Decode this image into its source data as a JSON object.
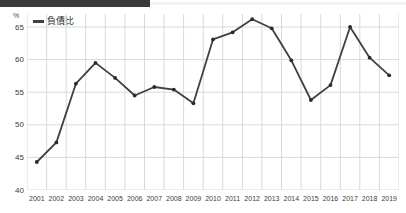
{
  "chart_data": {
    "type": "line",
    "title": "",
    "xlabel": "",
    "ylabel": "%",
    "unit_label": "%",
    "categories": [
      "2001",
      "2002",
      "2003",
      "2004",
      "2005",
      "2006",
      "2007",
      "2008",
      "2009",
      "2010",
      "2011",
      "2012",
      "2013",
      "2014",
      "2015",
      "2016",
      "2017",
      "2018",
      "2019"
    ],
    "series": [
      {
        "name": "負債比",
        "values": [
          44.3,
          47.3,
          56.3,
          59.5,
          57.2,
          54.5,
          55.8,
          55.4,
          53.3,
          63.1,
          64.2,
          66.2,
          64.8,
          59.9,
          53.8,
          56.1,
          65.0,
          60.3,
          57.6
        ]
      }
    ],
    "ylim": [
      40,
      67
    ],
    "yticks": [
      40,
      45,
      50,
      55,
      60,
      65
    ],
    "grid": true,
    "legend_position": "top-left",
    "line_color": "#404040",
    "marker_color": "#2b2b2b",
    "grid_color": "#d9d9d9"
  },
  "legend": {
    "label": "負債比",
    "swatch_color": "#404040"
  },
  "axes": {
    "y_unit": "%",
    "y_labels": [
      "65",
      "60",
      "55",
      "50",
      "45",
      "40"
    ],
    "x_labels": [
      "2001",
      "2002",
      "2003",
      "2004",
      "2005",
      "2006",
      "2007",
      "2008",
      "2009",
      "2010",
      "2011",
      "2012",
      "2013",
      "2014",
      "2015",
      "2016",
      "2017",
      "2018",
      "2019"
    ]
  },
  "header": {
    "bar_color": "#3a3a3a"
  }
}
